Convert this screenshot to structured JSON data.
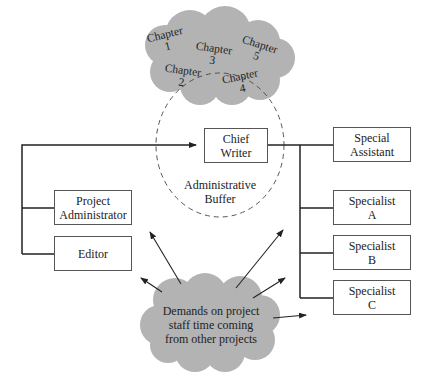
{
  "chapters": [
    {
      "title": "Chapter",
      "num": "1"
    },
    {
      "title": "Chapter",
      "num": "2"
    },
    {
      "title": "Chapter",
      "num": "3"
    },
    {
      "title": "Chapter",
      "num": "4"
    },
    {
      "title": "Chapter",
      "num": "5"
    }
  ],
  "chief_writer": {
    "line1": "Chief",
    "line2": "Writer"
  },
  "buffer": {
    "line1": "Administrative",
    "line2": "Buffer"
  },
  "project_administrator": {
    "line1": "Project",
    "line2": "Administrator"
  },
  "editor": {
    "line1": "Editor"
  },
  "special_assistant": {
    "line1": "Special",
    "line2": "Assistant"
  },
  "specialists": [
    {
      "line1": "Specialist",
      "line2": "A"
    },
    {
      "line1": "Specialist",
      "line2": "B"
    },
    {
      "line1": "Specialist",
      "line2": "C"
    }
  ],
  "demands_cloud": {
    "line1": "Demands on project",
    "line2": "staff time coming",
    "line3": "from other projects"
  },
  "colors": {
    "cloud": "#b3b3b3",
    "line": "#222222",
    "box_border": "#555555"
  }
}
